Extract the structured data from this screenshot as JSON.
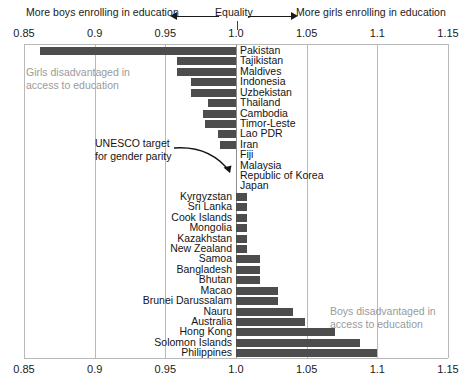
{
  "header": {
    "left_note": "More boys enrolling in education",
    "center_note": "Equality",
    "right_note": "More girls enrolling in education",
    "left_arrow_icon": "arrow-left-icon",
    "right_arrow_icon": "arrow-right-icon"
  },
  "annotations": {
    "girls_disadvantaged": "Girls disadvantaged in\naccess to education",
    "boys_disadvantaged": "Boys disadvantaged in\naccess to education",
    "unesco_target": "UNESCO target\nfor gender parity",
    "unesco_arrow_icon": "curved-arrow-icon"
  },
  "colors": {
    "bar": "#4d4d4d",
    "grid": "#b9b9b9",
    "equality_line": "#8e8e8e",
    "note_muted": "#9a9a9a",
    "text": "#141414"
  },
  "chart_data": {
    "type": "bar",
    "orientation": "horizontal",
    "title": "",
    "subtitle": "",
    "xlabel": "",
    "ylabel": "",
    "xlim": [
      0.85,
      1.15
    ],
    "baseline": 1.0,
    "grid": true,
    "legend": "none",
    "xticks": [
      "0.85",
      "0.9",
      "0.95",
      "1.0",
      "1.05",
      "1.1",
      "1.15"
    ],
    "xtick_values": [
      0.85,
      0.9,
      0.95,
      1.0,
      1.05,
      1.1,
      1.15
    ],
    "categories": [
      "Pakistan",
      "Tajikistan",
      "Maldives",
      "Indonesia",
      "Uzbekistan",
      "Thailand",
      "Cambodia",
      "Timor-Leste",
      "Lao PDR",
      "Iran",
      "Fiji",
      "Malaysia",
      "Republic of Korea",
      "Japan",
      "Kyrgyzstan",
      "Sri Lanka",
      "Cook Islands",
      "Mongolia",
      "Kazakhstan",
      "New Zealand",
      "Samoa",
      "Bangladesh",
      "Bhutan",
      "Macao",
      "Brunei Darussalam",
      "Nauru",
      "Australia",
      "Hong Kong",
      "Solomon Islands",
      "Philippines"
    ],
    "values": [
      0.861,
      0.958,
      0.958,
      0.968,
      0.968,
      0.98,
      0.977,
      0.978,
      0.987,
      0.989,
      1.0,
      1.0,
      1.0,
      1.0,
      1.008,
      1.008,
      1.008,
      1.008,
      1.008,
      1.008,
      1.017,
      1.017,
      1.017,
      1.03,
      1.03,
      1.04,
      1.049,
      1.07,
      1.088,
      1.1
    ]
  }
}
